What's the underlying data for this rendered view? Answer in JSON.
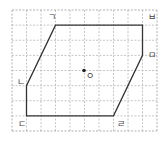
{
  "figure": {
    "type": "point-symmetric hexagon on square grid",
    "grid": {
      "columns": 10,
      "rows": 8
    },
    "vertices": [
      {
        "label": "ㄱ",
        "col": 3,
        "row": 1,
        "label_pos": "top-left"
      },
      {
        "label": "ㅂ",
        "col": 9,
        "row": 1,
        "label_pos": "top-right"
      },
      {
        "label": "ㅁ",
        "col": 9,
        "row": 3,
        "label_pos": "right"
      },
      {
        "label": "ㄹ",
        "col": 7,
        "row": 7,
        "label_pos": "bottom-right"
      },
      {
        "label": "ㄷ",
        "col": 1,
        "row": 7,
        "label_pos": "bottom-left"
      },
      {
        "label": "ㄴ",
        "col": 1,
        "row": 5,
        "label_pos": "left"
      }
    ],
    "center": {
      "label": "ㅇ",
      "col": 5,
      "row": 4
    },
    "colors": {
      "grid": "#b8b8b8",
      "shape": "#333333",
      "center": "#222222"
    }
  }
}
